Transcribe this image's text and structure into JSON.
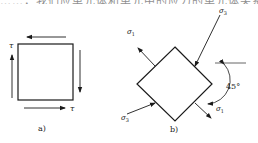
{
  "header": {
    "cropped_text": "……，我们应单元体和单元中的应力的单元体关系，"
  },
  "figure_a": {
    "caption": "a)",
    "tau_label_left": "τ",
    "tau_label_right": "τ"
  },
  "figure_b": {
    "caption": "b)",
    "sigma1_top_left": "σ",
    "sigma1_top_left_sub": "1",
    "sigma3_top_right": "σ",
    "sigma3_top_right_sub": "3",
    "sigma3_bottom_left": "σ",
    "sigma3_bottom_left_sub": "3",
    "sigma1_bottom_right": "σ",
    "sigma1_bottom_right_sub": "1",
    "angle_label": "45°"
  },
  "colors": {
    "stroke": "#1a1a1a",
    "background": "#ffffff"
  }
}
